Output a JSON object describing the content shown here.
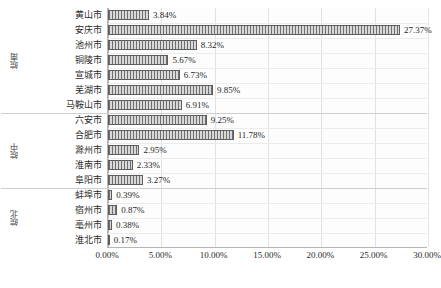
{
  "chart_data": {
    "type": "bar",
    "orientation": "horizontal",
    "title": "",
    "xlabel": "",
    "ylabel": "",
    "xlim": [
      0,
      30
    ],
    "grid": true,
    "legend": "none",
    "xticks": [
      "0.00%",
      "5.00%",
      "10.00%",
      "15.00%",
      "20.00%",
      "25.00%",
      "30.00%"
    ],
    "xtick_values": [
      0,
      5,
      10,
      15,
      20,
      25,
      30
    ],
    "categories": [
      "黄山市",
      "安庆市",
      "池州市",
      "铜陵市",
      "宣城市",
      "芜湖市",
      "马鞍山市",
      "六安市",
      "合肥市",
      "滁州市",
      "淮南市",
      "阜阳市",
      "蚌埠市",
      "宿州市",
      "亳州市",
      "淮北市"
    ],
    "values": [
      3.84,
      27.37,
      8.32,
      5.67,
      6.73,
      9.85,
      6.91,
      9.25,
      11.78,
      2.95,
      2.33,
      3.27,
      0.39,
      0.87,
      0.38,
      0.17
    ],
    "labels": [
      "3.84%",
      "27.37%",
      "8.32%",
      "5.67%",
      "6.73%",
      "9.85%",
      "6.91%",
      "9.25%",
      "11.78%",
      "2.95%",
      "2.33%",
      "3.27%",
      "0.39%",
      "0.87%",
      "0.38%",
      "0.17%"
    ],
    "groups": [
      {
        "label": "皖南",
        "start": 0,
        "count": 7
      },
      {
        "label": "皖中",
        "start": 7,
        "count": 5
      },
      {
        "label": "皖北",
        "start": 12,
        "count": 4
      }
    ],
    "colors": {
      "bar_fill": "#d3d3d3",
      "bar_hatch": "#6f6f6f",
      "bar_border": "#5d5d5d",
      "gridline": "#e2e2e2",
      "axis": "#b5b5b5",
      "text": "#1f1f1f"
    }
  }
}
